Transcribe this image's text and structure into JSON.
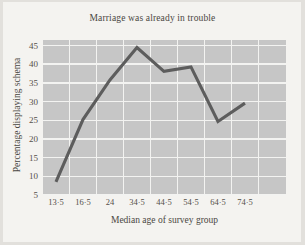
{
  "chart_data": {
    "type": "line",
    "title": "Marriage was already in trouble",
    "xlabel": "Median age of survey group",
    "ylabel": "Percentage displaying schema",
    "categories": [
      "13.5",
      "16.5",
      "24",
      "34.5",
      "44.5",
      "54.5",
      "64.5",
      "74.5"
    ],
    "x_tick_labels": [
      "13·5",
      "16·5",
      "24",
      "34·5",
      "44·5",
      "54·5",
      "64·5",
      "74·5"
    ],
    "values": [
      8.5,
      25.2,
      35.8,
      44.5,
      38.1,
      39.3,
      24.7,
      29.6
    ],
    "y_tick_labels": [
      "45",
      "40",
      "35",
      "30",
      "25",
      "20",
      "15",
      "10",
      "5"
    ],
    "y_ticks": [
      45,
      40,
      35,
      30,
      25,
      20,
      15,
      10,
      5
    ],
    "ylim": [
      5,
      46.5
    ],
    "xlim": [
      0,
      9
    ],
    "grid": true,
    "legend": "none",
    "series": [
      {
        "name": "Percentage displaying schema",
        "values": [
          8.5,
          25.2,
          35.8,
          44.5,
          38.1,
          39.3,
          24.7,
          29.6
        ]
      }
    ],
    "colors": {
      "line": "#5d5d5d",
      "plot_background": "#c6c6c6",
      "gridline": "#f3f3f1",
      "figure_background": "#f4f3f0",
      "text": "#4a4742"
    }
  }
}
